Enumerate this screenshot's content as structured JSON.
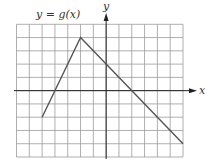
{
  "chart_data": {
    "type": "line",
    "title": "y = g(x)",
    "xlabel": "x",
    "ylabel": "y",
    "xlim": [
      -7,
      6
    ],
    "ylim": [
      -5,
      5
    ],
    "grid": true,
    "grid_step": 1,
    "tick_labels": false,
    "series": [
      {
        "name": "g(x)",
        "x": [
          -5,
          -2,
          6
        ],
        "y": [
          -2,
          4,
          -4
        ]
      }
    ],
    "annotations": [
      {
        "text": "y = g(x)",
        "position": "top-left"
      }
    ],
    "key_points": {
      "start": [
        -5,
        -2
      ],
      "peak": [
        -2,
        4
      ],
      "y_intercept": [
        0,
        2
      ],
      "x_intercepts": [
        [
          -4,
          0
        ],
        [
          2,
          0
        ]
      ],
      "end": [
        6,
        -4
      ]
    }
  },
  "colors": {
    "grid": "#9a9a9a",
    "axis": "#222222",
    "curve": "#555555",
    "label": "#333333"
  }
}
